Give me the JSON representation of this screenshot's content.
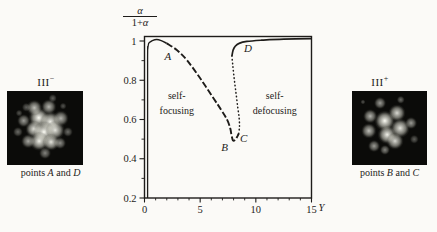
{
  "figure": {
    "background": "#fbfaf7",
    "ink": "#1e1c1a"
  },
  "left_panel": {
    "title_base": "III",
    "title_sup": "−",
    "caption": {
      "pre": "points ",
      "p1": "A",
      "mid": " and ",
      "p2": "D"
    },
    "image": {
      "bg": "#0b0b09",
      "spots": [
        {
          "x": 42,
          "y": 36,
          "r": 6,
          "o": 1.0
        },
        {
          "x": 57,
          "y": 42,
          "r": 6,
          "o": 0.95
        },
        {
          "x": 36,
          "y": 51,
          "r": 5,
          "o": 0.9
        },
        {
          "x": 49,
          "y": 55,
          "r": 6.5,
          "o": 1.0
        },
        {
          "x": 63,
          "y": 53,
          "r": 5.5,
          "o": 0.9
        },
        {
          "x": 42,
          "y": 68,
          "r": 5.5,
          "o": 0.95
        },
        {
          "x": 58,
          "y": 69,
          "r": 5,
          "o": 0.9
        },
        {
          "x": 36,
          "y": 23,
          "r": 4.5,
          "o": 0.75
        },
        {
          "x": 55,
          "y": 21,
          "r": 4.5,
          "o": 0.7
        },
        {
          "x": 71,
          "y": 37,
          "r": 4.5,
          "o": 0.7
        },
        {
          "x": 22,
          "y": 40,
          "r": 4,
          "o": 0.6
        },
        {
          "x": 28,
          "y": 68,
          "r": 4,
          "o": 0.65
        },
        {
          "x": 50,
          "y": 84,
          "r": 3.5,
          "o": 0.5
        },
        {
          "x": 70,
          "y": 70,
          "r": 3.5,
          "o": 0.55
        },
        {
          "x": 14,
          "y": 55,
          "r": 3,
          "o": 0.4
        },
        {
          "x": 60,
          "y": 10,
          "r": 2.5,
          "o": 0.35
        },
        {
          "x": 80,
          "y": 55,
          "r": 3,
          "o": 0.4
        },
        {
          "x": 25,
          "y": 22,
          "r": 2.5,
          "o": 0.35
        },
        {
          "x": 16,
          "y": 30,
          "r": 2,
          "o": 0.3
        },
        {
          "x": 74,
          "y": 20,
          "r": 2,
          "o": 0.3
        }
      ]
    }
  },
  "right_panel": {
    "title_base": "III",
    "title_sup": "+",
    "caption": {
      "pre": "points ",
      "p1": "B",
      "mid": " and ",
      "p2": "C"
    },
    "image": {
      "bg": "#0b0b09",
      "spots": [
        {
          "x": 44,
          "y": 40,
          "r": 6,
          "o": 1.0
        },
        {
          "x": 47,
          "y": 59,
          "r": 5.5,
          "o": 0.95
        },
        {
          "x": 60,
          "y": 30,
          "r": 5,
          "o": 0.85
        },
        {
          "x": 64,
          "y": 50,
          "r": 5.5,
          "o": 0.9
        },
        {
          "x": 57,
          "y": 68,
          "r": 5,
          "o": 0.85
        },
        {
          "x": 24,
          "y": 34,
          "r": 4,
          "o": 0.7
        },
        {
          "x": 22,
          "y": 54,
          "r": 4.5,
          "o": 0.75
        },
        {
          "x": 37,
          "y": 16,
          "r": 3.5,
          "o": 0.6
        },
        {
          "x": 79,
          "y": 43,
          "r": 3.5,
          "o": 0.6
        },
        {
          "x": 29,
          "y": 74,
          "r": 3.5,
          "o": 0.6
        },
        {
          "x": 44,
          "y": 80,
          "r": 3,
          "o": 0.5
        },
        {
          "x": 65,
          "y": 12,
          "r": 2.5,
          "o": 0.4
        },
        {
          "x": 83,
          "y": 65,
          "r": 2.5,
          "o": 0.35
        },
        {
          "x": 15,
          "y": 15,
          "r": 1.5,
          "o": 0.3
        }
      ]
    }
  },
  "chart_data": {
    "type": "line",
    "title": "",
    "xlabel": "Y",
    "ylabel_numerator": "α",
    "ylabel_denominator_pre": "1+",
    "ylabel_denominator_alpha": "α",
    "xlim": [
      0,
      15
    ],
    "ylim": [
      0.2,
      1.025
    ],
    "grid": false,
    "x_major_ticks": [
      0,
      5,
      10,
      15
    ],
    "x_minor_ticks": [
      1,
      2,
      3,
      4,
      6,
      7,
      8,
      9,
      11,
      12,
      13,
      14
    ],
    "y_major_ticks": [
      1,
      0.8,
      0.6,
      0.4,
      0.2
    ],
    "y_major_tick_labels": [
      "1",
      "0.8",
      "0.6",
      "0.4",
      "0.2"
    ],
    "y_minor_ticks": [
      0.9,
      0.7,
      0.5,
      0.3
    ],
    "series": [
      {
        "name": "threshold-rise",
        "style": "solid",
        "width": 1.3,
        "points": [
          [
            0.28,
            0.2
          ],
          [
            0.28,
            0.9
          ],
          [
            0.3,
            0.96
          ],
          [
            0.38,
            0.99
          ]
        ]
      },
      {
        "name": "upper-left-branch",
        "style": "solid",
        "width": 1.5,
        "points": [
          [
            0.38,
            0.99
          ],
          [
            0.7,
            1.002
          ],
          [
            1.1,
            1.007
          ],
          [
            1.5,
            1.002
          ],
          [
            2.0,
            0.988
          ]
        ]
      },
      {
        "name": "stable-descent",
        "style": "dashed",
        "width": 1.9,
        "points": [
          [
            2.0,
            0.988
          ],
          [
            2.9,
            0.954
          ],
          [
            3.8,
            0.903
          ],
          [
            5.0,
            0.81
          ],
          [
            6.2,
            0.708
          ],
          [
            6.9,
            0.648
          ],
          [
            7.4,
            0.601
          ],
          [
            7.7,
            0.556
          ],
          [
            7.8,
            0.525
          ],
          [
            7.95,
            0.493
          ],
          [
            8.15,
            0.497
          ],
          [
            8.35,
            0.515
          ],
          [
            8.46,
            0.528
          ]
        ]
      },
      {
        "name": "unstable-branch",
        "style": "dotted",
        "width": 1.5,
        "points": [
          [
            8.46,
            0.528
          ],
          [
            8.53,
            0.565
          ],
          [
            8.5,
            0.61
          ],
          [
            8.38,
            0.66
          ],
          [
            8.26,
            0.715
          ],
          [
            8.14,
            0.77
          ],
          [
            8.02,
            0.826
          ],
          [
            7.93,
            0.877
          ],
          [
            7.85,
            0.923
          ]
        ]
      },
      {
        "name": "upper-right-branch",
        "style": "solid",
        "width": 1.7,
        "points": [
          [
            7.85,
            0.923
          ],
          [
            7.95,
            0.952
          ],
          [
            8.15,
            0.973
          ],
          [
            8.5,
            0.988
          ],
          [
            9.2,
            0.998
          ],
          [
            10.5,
            1.004
          ],
          [
            12.5,
            1.009
          ],
          [
            15,
            1.012
          ]
        ]
      }
    ],
    "point_labels": [
      {
        "text": "A",
        "x": 2.1,
        "y": 0.922
      },
      {
        "text": "B",
        "x": 7.2,
        "y": 0.461
      },
      {
        "text": "C",
        "x": 8.9,
        "y": 0.504
      },
      {
        "text": "D",
        "x": 9.3,
        "y": 0.964
      }
    ],
    "region_labels": [
      {
        "lines": [
          "self-",
          "focusing"
        ],
        "x": 2.9,
        "y1": 0.722,
        "y2": 0.648
      },
      {
        "lines": [
          "self-",
          "defocusing"
        ],
        "x": 11.7,
        "y1": 0.722,
        "y2": 0.648
      }
    ]
  }
}
